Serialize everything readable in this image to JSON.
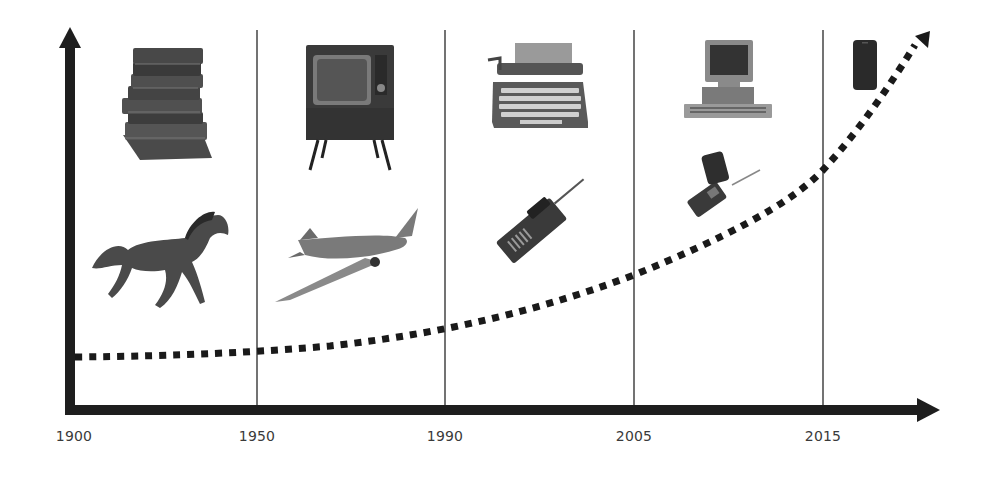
{
  "diagram": {
    "title": "",
    "colors": {
      "axis": "#1e1e1e",
      "divider": "#444444",
      "trend": "#1a1a1a",
      "label": "#3a3a3a",
      "background": "#ffffff"
    },
    "x_axis": {
      "ticks": [
        {
          "label": "1900",
          "x": 74
        },
        {
          "label": "1950",
          "x": 257
        },
        {
          "label": "1990",
          "x": 445
        },
        {
          "label": "2005",
          "x": 634
        },
        {
          "label": "2015",
          "x": 823
        }
      ]
    },
    "eras": [
      {
        "start": "1900",
        "end": "1950",
        "top_item": "stack of books",
        "bottom_item": "galloping horse"
      },
      {
        "start": "1950",
        "end": "1990",
        "top_item": "vintage television set",
        "bottom_item": "propeller airplane"
      },
      {
        "start": "1990",
        "end": "2005",
        "top_item": "typewriter",
        "bottom_item": "brick mobile phone"
      },
      {
        "start": "2005",
        "end": "2015",
        "top_item": "desktop personal computer",
        "bottom_item": "flip phone"
      },
      {
        "start": "2015",
        "end": "",
        "top_item": "smartphone",
        "bottom_item": ""
      }
    ],
    "trend_line": {
      "style": "dotted",
      "shape": "exponential growth with arrowhead",
      "points": [
        [
          75,
          357
        ],
        [
          257,
          352
        ],
        [
          445,
          328
        ],
        [
          634,
          275
        ],
        [
          823,
          170
        ],
        [
          920,
          40
        ]
      ]
    }
  }
}
